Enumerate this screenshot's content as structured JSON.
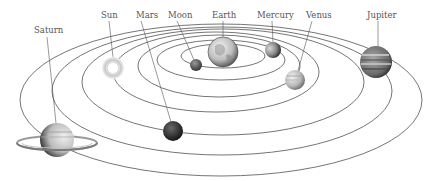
{
  "colors": {
    "background": "#ffffff",
    "orbit_line": "#3a3a3a",
    "label_text": "#555555"
  },
  "center_body": "Earth",
  "orbits": [
    {
      "name": "Moon orbit",
      "cx": 223,
      "cy": 56,
      "rx": 42,
      "ry": 12
    },
    {
      "name": "Mercury orbit",
      "cx": 221,
      "cy": 60,
      "rx": 64,
      "ry": 20
    },
    {
      "name": "Venus orbit",
      "cx": 219,
      "cy": 66,
      "rx": 81,
      "ry": 31
    },
    {
      "name": "Sun orbit",
      "cx": 216,
      "cy": 72,
      "rx": 103,
      "ry": 40
    },
    {
      "name": "Mars orbit",
      "cx": 223,
      "cy": 82,
      "rx": 141,
      "ry": 53
    },
    {
      "name": "Jupiter orbit",
      "cx": 222,
      "cy": 91,
      "rx": 170,
      "ry": 64
    },
    {
      "name": "Saturn orbit",
      "cx": 221,
      "cy": 100,
      "rx": 201,
      "ry": 76
    }
  ],
  "bodies": [
    {
      "id": "saturn",
      "label": "Saturn",
      "x": 57,
      "y": 140,
      "r": 17,
      "label_x": 39,
      "label_y": 34
    },
    {
      "id": "sun",
      "label": "Sun",
      "x": 113,
      "y": 68,
      "r": 10,
      "label_x": 109,
      "label_y": 18
    },
    {
      "id": "mars",
      "label": "Mars",
      "x": 173,
      "y": 131,
      "r": 10,
      "label_x": 145,
      "label_y": 18
    },
    {
      "id": "moon",
      "label": "Moon",
      "x": 196,
      "y": 65,
      "r": 6,
      "label_x": 178,
      "label_y": 18
    },
    {
      "id": "earth",
      "label": "Earth",
      "x": 223,
      "y": 52,
      "r": 15,
      "label_x": 224,
      "label_y": 18
    },
    {
      "id": "mercury",
      "label": "Mercury",
      "x": 273,
      "y": 50,
      "r": 8,
      "label_x": 272,
      "label_y": 18
    },
    {
      "id": "venus",
      "label": "Venus",
      "x": 295,
      "y": 80,
      "r": 10,
      "label_x": 318,
      "label_y": 18
    },
    {
      "id": "jupiter",
      "label": "Jupiter",
      "x": 376,
      "y": 62,
      "r": 16,
      "label_x": 380,
      "label_y": 18
    }
  ],
  "labels": {
    "saturn": "Saturn",
    "sun": "Sun",
    "mars": "Mars",
    "moon": "Moon",
    "earth": "Earth",
    "mercury": "Mercury",
    "venus": "Venus",
    "jupiter": "Jupiter"
  }
}
